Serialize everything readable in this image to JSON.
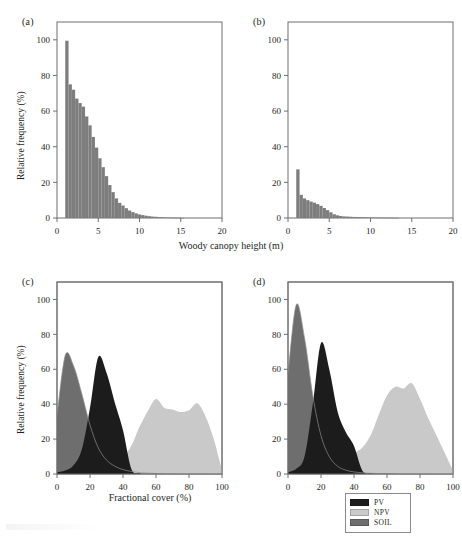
{
  "figure": {
    "panels": [
      "(a)",
      "(b)",
      "(c)",
      "(d)"
    ],
    "shared_ylabel": "Relative frequency (%)",
    "top_xlabel": "Woody canopy height (m)",
    "bottom_xlabel": "Fractional cover (%)"
  },
  "legend": {
    "items": [
      {
        "label": "PV",
        "color": "#1c1c1c"
      },
      {
        "label": "NPV",
        "color": "#c9c9c9"
      },
      {
        "label": "SOIL",
        "color": "#6e6e6e"
      }
    ]
  },
  "colors": {
    "histogram": "#7d7d7d",
    "pv": "#1c1c1c",
    "npv": "#c9c9c9",
    "soil": "#6e6e6e",
    "axis": "#6f6f6f",
    "text": "#231f20",
    "background": "#ffffff"
  },
  "chart_data": [
    {
      "type": "bar",
      "panel": "(a)",
      "title": "",
      "xlabel": "Woody canopy height (m)",
      "ylabel": "Relative frequency (%)",
      "xlim": [
        0,
        20
      ],
      "ylim": [
        0,
        110
      ],
      "xticks": [
        0,
        5,
        10,
        15,
        20
      ],
      "yticks": [
        0,
        20,
        40,
        60,
        80,
        100
      ],
      "grid": false,
      "bin_width": 0.4,
      "bin_starts": [
        1.0,
        1.4,
        1.8,
        2.2,
        2.6,
        3.0,
        3.4,
        3.8,
        4.2,
        4.6,
        5.0,
        5.4,
        5.8,
        6.2,
        6.6,
        7.0,
        7.4,
        7.8,
        8.2,
        8.6,
        9.0,
        9.4,
        9.8,
        10.2,
        10.6,
        11.0,
        11.4,
        11.8,
        12.2,
        12.6,
        13.0,
        13.4,
        13.8,
        14.2,
        14.6,
        15.0
      ],
      "values": [
        99.5,
        75.0,
        72.0,
        67.0,
        64.5,
        62.5,
        57.0,
        52.0,
        45.5,
        39.5,
        33.5,
        28.5,
        23.5,
        18.5,
        14.5,
        11.0,
        8.5,
        7.0,
        5.5,
        4.2,
        3.3,
        2.6,
        2.0,
        1.6,
        1.3,
        1.0,
        0.8,
        0.7,
        0.5,
        0.4,
        0.35,
        0.3,
        0.25,
        0.2,
        0.15,
        0.1
      ]
    },
    {
      "type": "bar",
      "panel": "(b)",
      "title": "",
      "xlabel": "Woody canopy height (m)",
      "ylabel": "Relative frequency (%)",
      "xlim": [
        0,
        20
      ],
      "ylim": [
        0,
        110
      ],
      "xticks": [
        0,
        5,
        10,
        15,
        20
      ],
      "yticks": [
        0,
        20,
        40,
        60,
        80,
        100
      ],
      "grid": false,
      "bin_width": 0.4,
      "bin_starts": [
        1.0,
        1.4,
        1.8,
        2.2,
        2.6,
        3.0,
        3.4,
        3.8,
        4.2,
        4.6,
        5.0,
        5.4,
        5.8,
        6.2,
        6.6,
        7.0,
        7.4,
        7.8,
        8.2,
        8.6,
        9.0,
        9.4,
        9.8,
        10.2,
        10.6,
        11.0,
        11.4,
        11.8,
        12.2,
        12.6,
        13.0
      ],
      "values": [
        27.3,
        13.0,
        11.0,
        10.0,
        9.2,
        8.6,
        7.8,
        6.8,
        5.6,
        4.4,
        3.2,
        2.1,
        1.5,
        1.1,
        0.9,
        0.8,
        0.7,
        0.6,
        0.55,
        0.5,
        0.45,
        0.4,
        0.35,
        0.3,
        0.28,
        0.25,
        0.22,
        0.2,
        0.18,
        0.15,
        0.12
      ]
    },
    {
      "type": "area",
      "panel": "(c)",
      "title": "",
      "xlabel": "Fractional cover (%)",
      "ylabel": "Relative frequency (%)",
      "xlim": [
        0,
        100
      ],
      "ylim": [
        0,
        110
      ],
      "xticks": [
        0,
        20,
        40,
        60,
        80,
        100
      ],
      "yticks": [
        0,
        20,
        40,
        60,
        80,
        100
      ],
      "grid": false,
      "x": [
        0,
        5,
        10,
        15,
        20,
        25,
        30,
        35,
        40,
        45,
        50,
        55,
        60,
        65,
        70,
        75,
        80,
        85,
        90,
        95,
        100
      ],
      "series": [
        {
          "name": "SOIL",
          "color": "#6e6e6e",
          "values": [
            33,
            68,
            62,
            46,
            28,
            15,
            8,
            4.5,
            2.5,
            1.5,
            0.8,
            0.5,
            0.3,
            0.2,
            0.15,
            0.1,
            0.1,
            0.05,
            0.05,
            0.0,
            0.0
          ]
        },
        {
          "name": "PV",
          "color": "#1c1c1c",
          "values": [
            1,
            2,
            5,
            14,
            38,
            67,
            58,
            41,
            25,
            3,
            0.5,
            0.2,
            0.1,
            0.0,
            0.0,
            0.0,
            0.0,
            0.0,
            0.0,
            0.0,
            0.0
          ]
        },
        {
          "name": "NPV",
          "color": "#c9c9c9",
          "values": [
            0,
            0.3,
            1,
            2,
            3.5,
            5,
            6.5,
            8,
            10,
            16,
            27,
            36,
            43,
            38,
            37,
            35.5,
            36.5,
            40.5,
            33,
            20,
            2
          ]
        }
      ]
    },
    {
      "type": "area",
      "panel": "(d)",
      "title": "",
      "xlabel": "Fractional cover (%)",
      "ylabel": "Relative frequency (%)",
      "xlim": [
        0,
        100
      ],
      "ylim": [
        0,
        110
      ],
      "xticks": [
        0,
        20,
        40,
        60,
        80,
        100
      ],
      "yticks": [
        0,
        20,
        40,
        60,
        80,
        100
      ],
      "grid": false,
      "x": [
        0,
        5,
        10,
        15,
        20,
        25,
        30,
        35,
        40,
        45,
        50,
        55,
        60,
        65,
        70,
        75,
        80,
        85,
        90,
        95,
        100
      ],
      "series": [
        {
          "name": "SOIL",
          "color": "#6e6e6e",
          "values": [
            57,
            97,
            78,
            45,
            22,
            10,
            4.5,
            2.2,
            1.2,
            0.7,
            0.4,
            0.3,
            0.2,
            0.15,
            0.1,
            0.1,
            0.05,
            0.05,
            0.0,
            0.0,
            0.0
          ]
        },
        {
          "name": "PV",
          "color": "#1c1c1c",
          "values": [
            1,
            3,
            10,
            40,
            75,
            60,
            36,
            24,
            16,
            2,
            0.4,
            0.2,
            0.1,
            0.0,
            0.0,
            0.0,
            0.0,
            0.0,
            0.0,
            0.0,
            0.0
          ]
        },
        {
          "name": "NPV",
          "color": "#c9c9c9",
          "values": [
            0,
            0.2,
            0.6,
            1.5,
            3,
            5,
            7,
            9.5,
            12,
            15,
            22,
            34,
            45,
            50,
            49,
            52,
            43,
            32,
            22,
            12,
            2
          ]
        }
      ]
    }
  ]
}
